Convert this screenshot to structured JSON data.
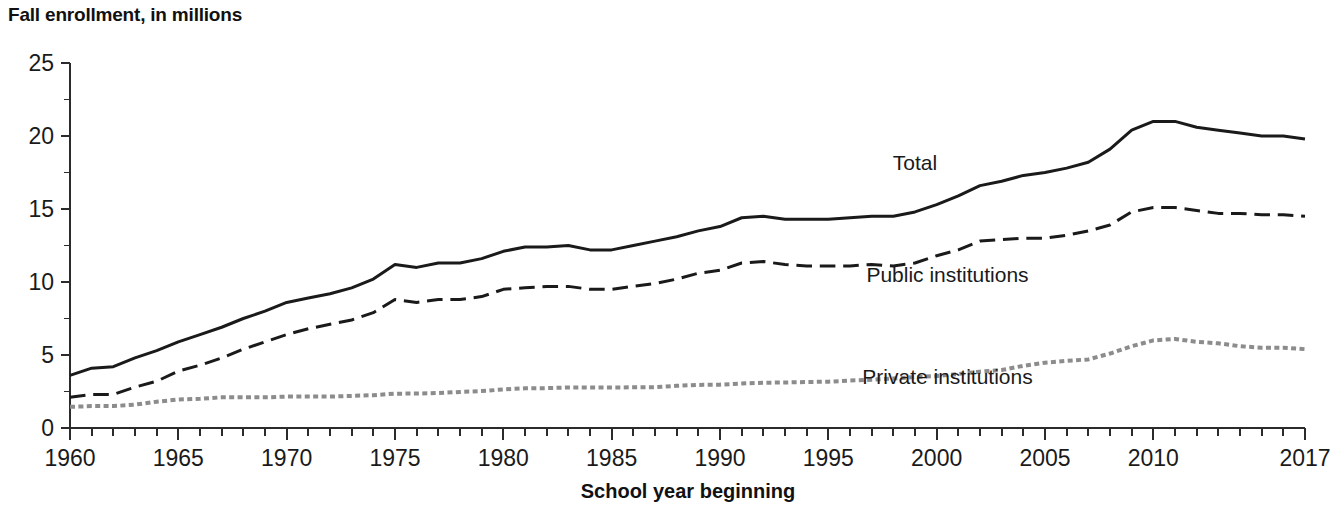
{
  "figure": {
    "title": "Fall enrollment, in millions",
    "background": "#ffffff"
  },
  "chart_data": {
    "type": "line",
    "title": "Fall enrollment, in millions",
    "xlabel": "School year beginning",
    "ylabel": "Fall enrollment, in millions",
    "xlim": [
      1960,
      2017
    ],
    "ylim": [
      0,
      25
    ],
    "grid": false,
    "legend_position": "inline-annotations",
    "x_tick_labels": [
      "1960",
      "1965",
      "1970",
      "1975",
      "1980",
      "1985",
      "1990",
      "1995",
      "2000",
      "2005",
      "2010",
      "2017"
    ],
    "x_tick_values": [
      1960,
      1965,
      1970,
      1975,
      1980,
      1985,
      1990,
      1995,
      2000,
      2005,
      2010,
      2017
    ],
    "x_minor_tick_step": 1,
    "y_tick_labels": [
      "0",
      "5",
      "10",
      "15",
      "20",
      "25"
    ],
    "y_tick_values": [
      0,
      5,
      10,
      15,
      20,
      25
    ],
    "y_minor_tick_step": 2.5,
    "x": [
      1960,
      1961,
      1962,
      1963,
      1964,
      1965,
      1966,
      1967,
      1968,
      1969,
      1970,
      1971,
      1972,
      1973,
      1974,
      1975,
      1976,
      1977,
      1978,
      1979,
      1980,
      1981,
      1982,
      1983,
      1984,
      1985,
      1986,
      1987,
      1988,
      1989,
      1990,
      1991,
      1992,
      1993,
      1994,
      1995,
      1996,
      1997,
      1998,
      1999,
      2000,
      2001,
      2002,
      2003,
      2004,
      2005,
      2006,
      2007,
      2008,
      2009,
      2010,
      2011,
      2012,
      2013,
      2014,
      2015,
      2016,
      2017
    ],
    "series": [
      {
        "name": "Total",
        "label": "Total",
        "style": "solid",
        "color": "#1a1a1a",
        "width": 3.0,
        "label_x": 1999.0,
        "label_y": 17.7,
        "values": [
          3.6,
          4.1,
          4.2,
          4.8,
          5.3,
          5.9,
          6.4,
          6.9,
          7.5,
          8.0,
          8.6,
          8.9,
          9.2,
          9.6,
          10.2,
          11.2,
          11.0,
          11.3,
          11.3,
          11.6,
          12.1,
          12.4,
          12.4,
          12.5,
          12.2,
          12.2,
          12.5,
          12.8,
          13.1,
          13.5,
          13.8,
          14.4,
          14.5,
          14.3,
          14.3,
          14.3,
          14.4,
          14.5,
          14.5,
          14.8,
          15.3,
          15.9,
          16.6,
          16.9,
          17.3,
          17.5,
          17.8,
          18.2,
          19.1,
          20.4,
          21.0,
          21.0,
          20.6,
          20.4,
          20.2,
          20.0,
          20.0,
          19.8
        ]
      },
      {
        "name": "Public institutions",
        "label": "Public institutions",
        "style": "dashed",
        "color": "#1a1a1a",
        "width": 3.0,
        "label_x": 2000.5,
        "label_y": 10.0,
        "values": [
          2.1,
          2.3,
          2.3,
          2.8,
          3.2,
          3.9,
          4.3,
          4.8,
          5.4,
          5.9,
          6.4,
          6.8,
          7.1,
          7.4,
          7.9,
          8.8,
          8.6,
          8.8,
          8.8,
          9.0,
          9.5,
          9.6,
          9.7,
          9.7,
          9.5,
          9.5,
          9.7,
          9.9,
          10.2,
          10.6,
          10.8,
          11.3,
          11.4,
          11.2,
          11.1,
          11.1,
          11.1,
          11.2,
          11.1,
          11.3,
          11.8,
          12.2,
          12.8,
          12.9,
          13.0,
          13.0,
          13.2,
          13.5,
          13.9,
          14.8,
          15.1,
          15.1,
          14.9,
          14.7,
          14.7,
          14.6,
          14.6,
          14.5
        ]
      },
      {
        "name": "Private institutions",
        "label": "Private institutions",
        "style": "dotted",
        "color": "#8c8c8c",
        "width": 4.0,
        "label_x": 2000.5,
        "label_y": 3.0,
        "values": [
          1.45,
          1.5,
          1.5,
          1.6,
          1.8,
          1.95,
          2.0,
          2.1,
          2.1,
          2.1,
          2.15,
          2.15,
          2.15,
          2.2,
          2.25,
          2.35,
          2.36,
          2.4,
          2.47,
          2.53,
          2.64,
          2.72,
          2.73,
          2.78,
          2.77,
          2.77,
          2.79,
          2.8,
          2.89,
          2.95,
          2.97,
          3.05,
          3.1,
          3.12,
          3.15,
          3.17,
          3.25,
          3.3,
          3.39,
          3.49,
          3.56,
          3.7,
          3.86,
          3.97,
          4.26,
          4.47,
          4.6,
          4.7,
          5.1,
          5.6,
          6.0,
          6.1,
          5.9,
          5.8,
          5.6,
          5.5,
          5.5,
          5.4
        ]
      }
    ]
  },
  "plot_geometry": {
    "x_origin_px": 70,
    "x_end_px": 1305,
    "y_zero_px": 428,
    "y_top_px": 63
  }
}
